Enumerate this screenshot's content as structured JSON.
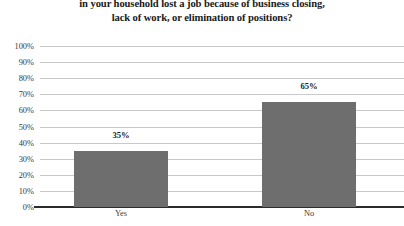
{
  "chart_data": {
    "type": "bar",
    "title": "in your household lost a job because of business closing, lack of work, or elimination of positions?",
    "title_lines": [
      "in your household lost a job because of business closing,",
      "lack of work, or elimination of positions?"
    ],
    "categories": [
      "Yes",
      "No"
    ],
    "values": [
      35,
      65
    ],
    "value_labels": [
      "35%",
      "65%"
    ],
    "xlabel": "",
    "ylabel": "",
    "ylim": [
      0,
      100
    ],
    "ytick_step": 10,
    "ytick_labels": [
      "100%",
      "90%",
      "80%",
      "70%",
      "60%",
      "50%",
      "40%",
      "30%",
      "20%",
      "10%",
      "0%"
    ],
    "ytick_values": [
      100,
      90,
      80,
      70,
      60,
      50,
      40,
      30,
      20,
      10,
      0
    ],
    "grid": true,
    "legend": false,
    "bar_color": "#6e6e6e",
    "gridline_color": "#c9c9c9",
    "axis_color": "#2b2b2b",
    "text_color": "#1a1a1a"
  }
}
